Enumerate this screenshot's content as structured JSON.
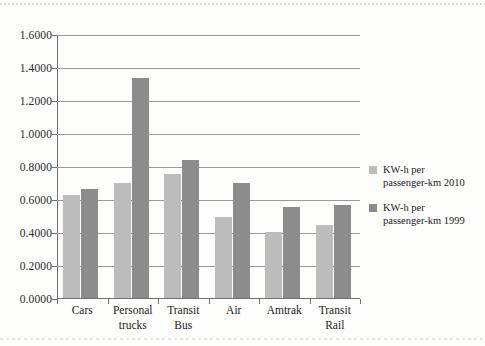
{
  "chart_data": {
    "type": "bar",
    "title": "",
    "subtitle": "",
    "xlabel": "",
    "ylabel": "",
    "categories": [
      "Cars",
      "Personal trucks",
      "Transit Bus",
      "Air",
      "Amtrak",
      "Transit Rail"
    ],
    "category_lines": [
      [
        "Cars"
      ],
      [
        "Personal",
        "trucks"
      ],
      [
        "Transit",
        "Bus"
      ],
      [
        "Air"
      ],
      [
        "Amtrak"
      ],
      [
        "Transit",
        "Rail"
      ]
    ],
    "series": [
      {
        "name": "KW-h per passenger-km 2010",
        "name_lines": [
          "KW-h per",
          "passenger-km 2010"
        ],
        "color": "#bcbcbc",
        "values": [
          0.625,
          0.695,
          0.75,
          0.49,
          0.4,
          0.445
        ]
      },
      {
        "name": "KW-h per passenger-km 1999",
        "name_lines": [
          "KW-h per",
          "passenger-km 1999"
        ],
        "color": "#8c8c8c",
        "values": [
          0.66,
          1.335,
          0.835,
          0.7,
          0.55,
          0.565
        ]
      }
    ],
    "ylim": [
      0.0,
      1.6
    ],
    "ytick_values": [
      0.0,
      0.2,
      0.4,
      0.6,
      0.8,
      1.0,
      1.2,
      1.4,
      1.6
    ],
    "ytick_labels": [
      "0.0000",
      "0.2000",
      "0.4000",
      "0.6000",
      "0.8000",
      "1.0000",
      "1.2000",
      "1.4000",
      "1.6000"
    ],
    "grid": true,
    "grid_axis": "y",
    "legend_position": "right"
  },
  "colors": {
    "series_2010": "#bcbcbc",
    "series_1999": "#8c8c8c",
    "gridline": "#9a9a9a",
    "axis": "#6f6f6f",
    "text": "#232323",
    "background": "#fdfdfc"
  }
}
